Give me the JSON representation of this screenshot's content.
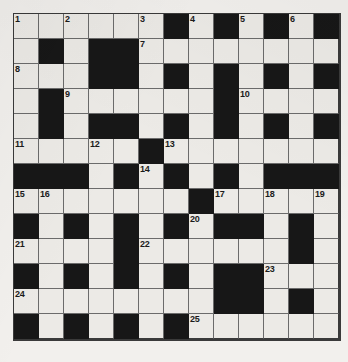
{
  "puzzle": {
    "type": "crossword-grid",
    "rows": 13,
    "cols": 13,
    "cell_size_px": 25,
    "colors": {
      "paper": "#f2f0ed",
      "white_cell": "#eceae6",
      "black_cell": "#171717",
      "grid_line": "#6b6b6b",
      "border": "#3a3a3a",
      "number_text": "#1b1b1b"
    },
    "legend": {
      "white": "open letter square",
      "black": "blocked square"
    },
    "grid": [
      [
        "white",
        "white",
        "white",
        "white",
        "white",
        "white",
        "black",
        "white",
        "black",
        "white",
        "black",
        "white",
        "black"
      ],
      [
        "white",
        "black",
        "white",
        "black",
        "black",
        "white",
        "white",
        "white",
        "white",
        "white",
        "white",
        "white",
        "white"
      ],
      [
        "white",
        "white",
        "white",
        "black",
        "black",
        "white",
        "black",
        "white",
        "black",
        "white",
        "black",
        "white",
        "black"
      ],
      [
        "white",
        "black",
        "white",
        "white",
        "white",
        "white",
        "white",
        "white",
        "black",
        "white",
        "white",
        "white",
        "white"
      ],
      [
        "white",
        "black",
        "white",
        "black",
        "black",
        "white",
        "black",
        "white",
        "black",
        "white",
        "black",
        "white",
        "black"
      ],
      [
        "white",
        "white",
        "white",
        "white",
        "white",
        "black",
        "white",
        "white",
        "white",
        "white",
        "white",
        "white",
        "white"
      ],
      [
        "black",
        "black",
        "black",
        "white",
        "black",
        "white",
        "black",
        "white",
        "black",
        "white",
        "black",
        "black",
        "black"
      ],
      [
        "white",
        "white",
        "white",
        "white",
        "white",
        "white",
        "white",
        "black",
        "white",
        "white",
        "white",
        "white",
        "white"
      ],
      [
        "black",
        "white",
        "black",
        "white",
        "black",
        "white",
        "black",
        "white",
        "black",
        "black",
        "white",
        "black",
        "white"
      ],
      [
        "white",
        "white",
        "white",
        "white",
        "black",
        "white",
        "white",
        "white",
        "white",
        "white",
        "white",
        "black",
        "white"
      ],
      [
        "black",
        "white",
        "black",
        "white",
        "black",
        "white",
        "black",
        "white",
        "black",
        "black",
        "white",
        "white",
        "white"
      ],
      [
        "white",
        "white",
        "white",
        "white",
        "white",
        "white",
        "white",
        "white",
        "black",
        "black",
        "white",
        "black",
        "white"
      ],
      [
        "black",
        "white",
        "black",
        "white",
        "black",
        "white",
        "black",
        "white",
        "white",
        "white",
        "white",
        "white",
        "white"
      ]
    ],
    "numbers": [
      {
        "row": 0,
        "col": 0,
        "label": "1"
      },
      {
        "row": 0,
        "col": 2,
        "label": "2"
      },
      {
        "row": 0,
        "col": 5,
        "label": "3"
      },
      {
        "row": 0,
        "col": 7,
        "label": "4"
      },
      {
        "row": 0,
        "col": 9,
        "label": "5"
      },
      {
        "row": 0,
        "col": 11,
        "label": "6"
      },
      {
        "row": 1,
        "col": 5,
        "label": "7"
      },
      {
        "row": 2,
        "col": 0,
        "label": "8"
      },
      {
        "row": 3,
        "col": 2,
        "label": "9"
      },
      {
        "row": 3,
        "col": 9,
        "label": "10"
      },
      {
        "row": 5,
        "col": 0,
        "label": "11"
      },
      {
        "row": 5,
        "col": 3,
        "label": "12"
      },
      {
        "row": 5,
        "col": 6,
        "label": "13"
      },
      {
        "row": 6,
        "col": 5,
        "label": "14"
      },
      {
        "row": 7,
        "col": 0,
        "label": "15"
      },
      {
        "row": 7,
        "col": 1,
        "label": "16"
      },
      {
        "row": 7,
        "col": 8,
        "label": "17"
      },
      {
        "row": 7,
        "col": 10,
        "label": "18"
      },
      {
        "row": 7,
        "col": 12,
        "label": "19"
      },
      {
        "row": 8,
        "col": 7,
        "label": "20"
      },
      {
        "row": 9,
        "col": 0,
        "label": "21"
      },
      {
        "row": 9,
        "col": 5,
        "label": "22"
      },
      {
        "row": 10,
        "col": 10,
        "label": "23"
      },
      {
        "row": 11,
        "col": 0,
        "label": "24"
      },
      {
        "row": 12,
        "col": 7,
        "label": "25"
      }
    ]
  }
}
